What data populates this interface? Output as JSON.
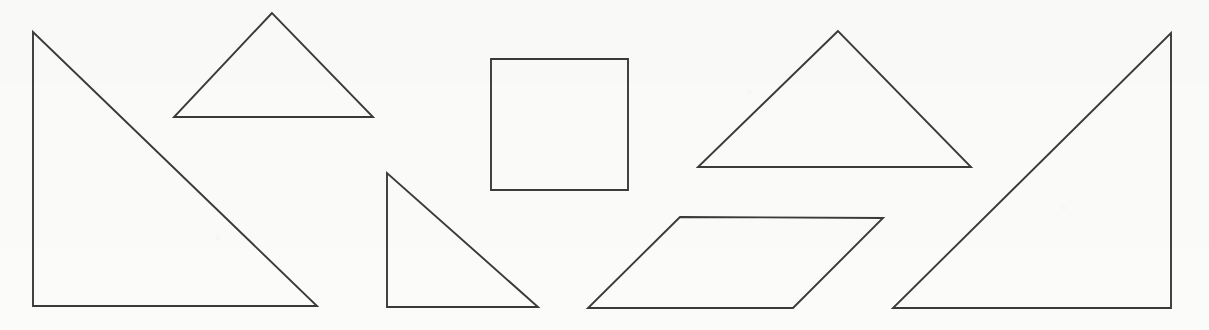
{
  "scene": {
    "title": "Geometric Shapes Figure",
    "width": 1209,
    "height": 330,
    "background_color": "#fbfbfa",
    "stroke_color": "#3a3a3a",
    "stroke_width": 1.9,
    "fill": "none",
    "shape_count": 6
  },
  "shapes": [
    {
      "id": "shape-1",
      "name": "large-right-triangle-left",
      "type": "right-triangle",
      "orientation": "hypotenuse-from-top-left-to-bottom-right",
      "points": "33,32 33,306 317,306",
      "vertices": [
        [
          33,
          32
        ],
        [
          33,
          306
        ],
        [
          317,
          306
        ]
      ],
      "bbox": [
        33,
        32,
        284,
        274
      ],
      "color": "#3a3a3a"
    },
    {
      "id": "shape-2",
      "name": "small-obtuse-triangle-top-left",
      "type": "triangle",
      "orientation": "apex-up",
      "points": "272,13 174,117 373,117",
      "vertices": [
        [
          272,
          13
        ],
        [
          174,
          117
        ],
        [
          373,
          117
        ]
      ],
      "bbox": [
        174,
        13,
        199,
        104
      ],
      "color": "#3a3a3a"
    },
    {
      "id": "shape-3",
      "name": "small-right-triangle-center",
      "type": "right-triangle",
      "orientation": "hypotenuse-from-top-left-to-bottom-right",
      "points": "387,173 387,307 538,307",
      "vertices": [
        [
          387,
          173
        ],
        [
          387,
          307
        ],
        [
          538,
          307
        ]
      ],
      "bbox": [
        387,
        173,
        151,
        134
      ],
      "color": "#3a3a3a"
    },
    {
      "id": "shape-4",
      "name": "square-center",
      "type": "square",
      "orientation": "axis-aligned",
      "points": "491,59 628,59 628,190 491,190",
      "vertices": [
        [
          491,
          59
        ],
        [
          628,
          59
        ],
        [
          628,
          190
        ],
        [
          491,
          190
        ]
      ],
      "bbox": [
        491,
        59,
        137,
        131
      ],
      "color": "#3a3a3a"
    },
    {
      "id": "shape-5",
      "name": "parallelogram-center-right",
      "type": "parallelogram",
      "orientation": "slanted-right",
      "points": "680,217 883,218 793,308 588,308",
      "vertices": [
        [
          680,
          217
        ],
        [
          883,
          218
        ],
        [
          793,
          308
        ],
        [
          588,
          308
        ]
      ],
      "bbox": [
        588,
        217,
        295,
        91
      ],
      "color": "#3a3a3a"
    },
    {
      "id": "shape-6",
      "name": "medium-obtuse-triangle-right",
      "type": "triangle",
      "orientation": "apex-up",
      "points": "838,31 698,167 971,167",
      "vertices": [
        [
          838,
          31
        ],
        [
          698,
          167
        ],
        [
          971,
          167
        ]
      ],
      "bbox": [
        698,
        31,
        273,
        136
      ],
      "color": "#3a3a3a"
    },
    {
      "id": "shape-7",
      "name": "large-right-triangle-right",
      "type": "right-triangle",
      "orientation": "hypotenuse-from-bottom-left-to-top-right",
      "points": "1171,33 1171,308 893,308",
      "vertices": [
        [
          1171,
          33
        ],
        [
          1171,
          308
        ],
        [
          893,
          308
        ]
      ],
      "bbox": [
        893,
        33,
        278,
        275
      ],
      "color": "#3a3a3a"
    }
  ]
}
